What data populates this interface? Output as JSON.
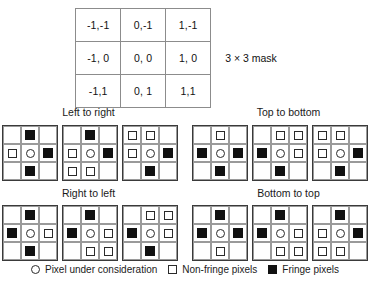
{
  "mask": {
    "caption": "3 × 3 mask",
    "rows": [
      [
        "-1,-1",
        "0,-1",
        "1,-1"
      ],
      [
        "-1, 0",
        "0, 0",
        "1, 0"
      ],
      [
        "-1,1",
        "0, 1",
        "1,1"
      ]
    ]
  },
  "groups": [
    {
      "id": "left-to-right",
      "label": "Left to right"
    },
    {
      "id": "top-to-bottom",
      "label": "Top to bottom"
    },
    {
      "id": "right-to-left",
      "label": "Right to left"
    },
    {
      "id": "bottom-to-top",
      "label": "Bottom to top"
    }
  ],
  "symbols": {
    "empty": "",
    "open_square": "non-fringe-pixel",
    "filled_square": "fringe-pixel",
    "circle": "pixel-under-consideration"
  },
  "grids": {
    "left-to-right": [
      {
        "name": "grid-ltr-1",
        "cells": [
          "empty",
          "filled",
          "empty",
          "open",
          "circle",
          "filled",
          "empty",
          "filled",
          "empty"
        ]
      },
      {
        "name": "grid-ltr-2",
        "cells": [
          "empty",
          "filled",
          "empty",
          "open",
          "circle",
          "filled",
          "open",
          "open",
          "empty"
        ]
      },
      {
        "name": "grid-ltr-3",
        "cells": [
          "open",
          "open",
          "empty",
          "open",
          "circle",
          "filled",
          "empty",
          "filled",
          "empty"
        ]
      }
    ],
    "top-to-bottom": [
      {
        "name": "grid-ttb-1",
        "cells": [
          "empty",
          "open",
          "empty",
          "filled",
          "circle",
          "filled",
          "empty",
          "filled",
          "empty"
        ]
      },
      {
        "name": "grid-ttb-2",
        "cells": [
          "empty",
          "open",
          "open",
          "filled",
          "circle",
          "open",
          "empty",
          "filled",
          "empty"
        ]
      },
      {
        "name": "grid-ttb-3",
        "cells": [
          "open",
          "open",
          "empty",
          "open",
          "circle",
          "filled",
          "empty",
          "filled",
          "empty"
        ]
      }
    ],
    "right-to-left": [
      {
        "name": "grid-rtl-1",
        "cells": [
          "empty",
          "filled",
          "empty",
          "filled",
          "circle",
          "open",
          "empty",
          "filled",
          "empty"
        ]
      },
      {
        "name": "grid-rtl-2",
        "cells": [
          "empty",
          "filled",
          "empty",
          "filled",
          "circle",
          "open",
          "empty",
          "open",
          "open"
        ]
      },
      {
        "name": "grid-rtl-3",
        "cells": [
          "empty",
          "open",
          "open",
          "filled",
          "circle",
          "open",
          "empty",
          "filled",
          "empty"
        ]
      }
    ],
    "bottom-to-top": [
      {
        "name": "grid-btt-1",
        "cells": [
          "empty",
          "filled",
          "empty",
          "filled",
          "circle",
          "filled",
          "empty",
          "open",
          "empty"
        ]
      },
      {
        "name": "grid-btt-2",
        "cells": [
          "empty",
          "filled",
          "empty",
          "filled",
          "circle",
          "open",
          "empty",
          "open",
          "open"
        ]
      },
      {
        "name": "grid-btt-3",
        "cells": [
          "empty",
          "filled",
          "empty",
          "open",
          "circle",
          "filled",
          "open",
          "open",
          "empty"
        ]
      }
    ]
  },
  "legend": [
    {
      "symbol": "circle",
      "label": "Pixel under consideration"
    },
    {
      "symbol": "open_square",
      "label": "Non-fringe pixels"
    },
    {
      "symbol": "filled_square",
      "label": "Fringe pixels"
    }
  ]
}
